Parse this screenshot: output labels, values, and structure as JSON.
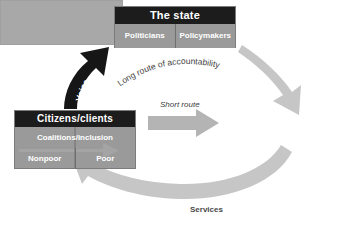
{
  "diagram": {
    "colors": {
      "header_dark": "#1c1c1c",
      "box_gray": "#9a9a9a",
      "provider_gray": "#a8a8a8",
      "arrow_light": "#c9c9c9",
      "arrow_mid": "#b0b0b0",
      "arrow_dark": "#1c1c1c",
      "background": "#ffffff",
      "text_light": "#ffffff",
      "text_dark": "#3c3c3c"
    },
    "state_box": {
      "title": "The state",
      "cells": [
        "Politicians",
        "Policymakers"
      ]
    },
    "citizens_box": {
      "title": "Citizens/clients",
      "coalitions": "Coalitions/inclusion",
      "cells": [
        "Nonpoor",
        "Poor"
      ]
    },
    "providers_box": {
      "title": ""
    },
    "arrows": [
      {
        "name": "voice-arrow",
        "label": "Voice",
        "style": "dark-curved",
        "from": "citizens-box",
        "to": "state-box"
      },
      {
        "name": "long-route-arrow",
        "label": "Long route of accountability",
        "style": "light-curved",
        "from": "state-box",
        "to": "providers-box"
      },
      {
        "name": "short-route-arrow",
        "label": "Short route",
        "style": "gray-straight",
        "from": "citizens-box",
        "to": "providers-box"
      },
      {
        "name": "services-arrow",
        "label": "Services",
        "style": "light-curved",
        "from": "providers-box",
        "to": "citizens-box"
      }
    ]
  }
}
